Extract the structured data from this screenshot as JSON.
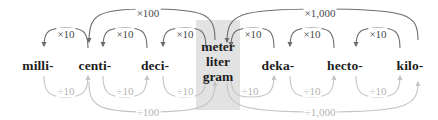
{
  "diagram": {
    "type": "metric-prefix-ladder",
    "colors": {
      "multiply_arrow": "#6e6e6e",
      "divide_arrow": "#c4c4c4",
      "multiply_text": "#4a4a4a",
      "divide_text": "#b4b4b4",
      "base_highlight": "#e2e2e2",
      "label_text": "#1d1d1d",
      "background": "#ffffff"
    },
    "units": [
      {
        "id": "milli",
        "label": "milli-",
        "x": 38
      },
      {
        "id": "centi",
        "label": "centi-",
        "x": 95
      },
      {
        "id": "deci",
        "label": "deci-",
        "x": 155
      },
      {
        "id": "base",
        "label": "meter liter gram",
        "x": 218
      },
      {
        "id": "deka",
        "label": "deka-",
        "x": 278
      },
      {
        "id": "hecto",
        "label": "hecto-",
        "x": 345
      },
      {
        "id": "kilo",
        "label": "kilo-",
        "x": 410
      }
    ],
    "base_unit": {
      "line1": "meter",
      "line2": "liter",
      "line3": "gram"
    },
    "multiply_steps": [
      {
        "label": "×10",
        "from": "centi",
        "to": "milli",
        "x": 66,
        "y": 34
      },
      {
        "label": "×10",
        "from": "deci",
        "to": "centi",
        "x": 125,
        "y": 34
      },
      {
        "label": "×10",
        "from": "base",
        "to": "deci",
        "x": 185,
        "y": 34
      },
      {
        "label": "×10",
        "from": "deka",
        "to": "base",
        "x": 253,
        "y": 34
      },
      {
        "label": "×10",
        "from": "hecto",
        "to": "deka",
        "x": 312,
        "y": 34
      },
      {
        "label": "×10",
        "from": "kilo",
        "to": "hecto",
        "x": 378,
        "y": 34
      }
    ],
    "divide_steps": [
      {
        "label": "÷10",
        "from": "milli",
        "to": "centi",
        "x": 66,
        "y": 91
      },
      {
        "label": "÷10",
        "from": "centi",
        "to": "deci",
        "x": 125,
        "y": 91
      },
      {
        "label": "÷10",
        "from": "deci",
        "to": "base",
        "x": 185,
        "y": 91
      },
      {
        "label": "÷10",
        "from": "base",
        "to": "deka",
        "x": 250,
        "y": 91
      },
      {
        "label": "÷10",
        "from": "deka",
        "to": "hecto",
        "x": 312,
        "y": 91
      },
      {
        "label": "÷10",
        "from": "hecto",
        "to": "kilo",
        "x": 378,
        "y": 91
      }
    ],
    "long_multiply_steps": [
      {
        "label": "×100",
        "from": "base",
        "to": "centi",
        "x": 148,
        "y": 13
      },
      {
        "label": "×1,000",
        "from": "kilo",
        "to": "base",
        "x": 320,
        "y": 13
      }
    ],
    "long_divide_steps": [
      {
        "label": "÷100",
        "from": "centi",
        "to": "base",
        "x": 148,
        "y": 112
      },
      {
        "label": "÷1,000",
        "from": "base",
        "to": "kilo",
        "x": 320,
        "y": 112
      }
    ]
  }
}
